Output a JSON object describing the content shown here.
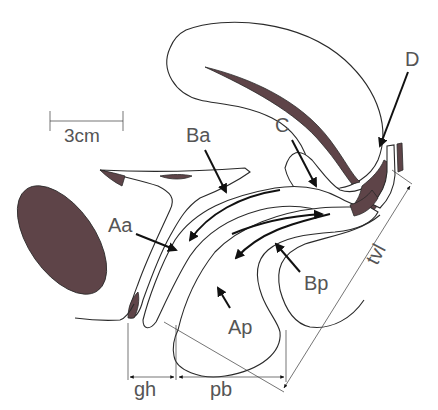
{
  "colors": {
    "tissue_fill": "#5e4448",
    "line": "#2a2a2a",
    "label": "#555555",
    "background": "#ffffff"
  },
  "scale_bar": {
    "label": "3cm"
  },
  "labels": {
    "Ba": "Ba",
    "C": "C",
    "D": "D",
    "Aa": "Aa",
    "Ap": "Ap",
    "Bp": "Bp",
    "tvl": "tvl"
  },
  "measurements": {
    "gh": "gh",
    "pb": "pb",
    "tvl": "tvl"
  },
  "structures": [
    "pubic-bone",
    "bladder",
    "urethra",
    "uterus",
    "cervix",
    "vagina",
    "rectum",
    "perineal-body"
  ]
}
